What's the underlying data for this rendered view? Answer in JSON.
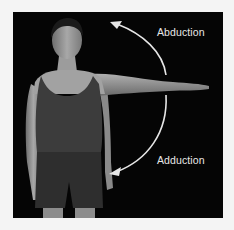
{
  "figure": {
    "labels": {
      "abduction": "Abduction",
      "adduction": "Adduction"
    },
    "colors": {
      "background": "#050505",
      "arrow": "#e6e6e6",
      "text": "#e8e8e8",
      "skin": "#9a9a9a",
      "clothing": "#3a3a3a"
    }
  }
}
